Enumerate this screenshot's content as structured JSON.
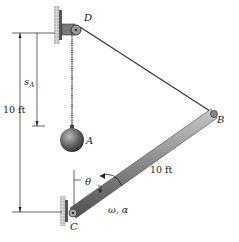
{
  "diagram": {
    "points": {
      "D": "D",
      "A": "A",
      "B": "B",
      "C": "C"
    },
    "dimensions": {
      "total_height": "10 ft",
      "rod_length": "10 ft",
      "sA_main": "s",
      "sA_sub": "A"
    },
    "angle_label": "θ",
    "kinematics_label": "ω, α",
    "colors": {
      "rod": "#8a8a8a",
      "rod_dark": "#5a5a5a",
      "ball": "#6e6e6e",
      "wall": "#9a9a9a",
      "line": "#222222"
    }
  }
}
